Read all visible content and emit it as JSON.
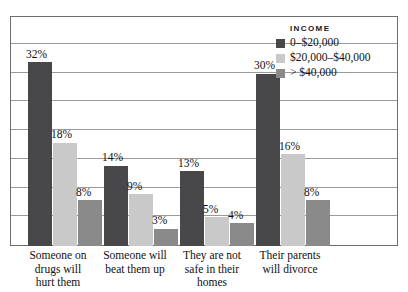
{
  "legend": {
    "title": "INCOME",
    "items": [
      {
        "label": "0–$20,000",
        "color": "#48484a"
      },
      {
        "label": "$20,000–$40,000",
        "color": "#c9c9c9"
      },
      {
        "label": "> $40,000",
        "color": "#8a8a8a"
      }
    ]
  },
  "chart_data": {
    "type": "bar",
    "title": "",
    "xlabel": "",
    "ylabel": "",
    "ylim": [
      0,
      40
    ],
    "grid": true,
    "gridline_values": [
      5,
      10,
      15,
      20,
      25,
      30,
      35,
      40
    ],
    "legend_position": "top-right",
    "categories": [
      "Someone on drugs will hurt them",
      "Someone will beat them up",
      "They are not safe in their homes",
      "Their parents will divorce"
    ],
    "category_lines": [
      [
        "Someone on",
        "drugs will",
        "hurt them"
      ],
      [
        "Someone will",
        "beat them up"
      ],
      [
        "They are not",
        "safe in their",
        "homes"
      ],
      [
        "Their parents",
        "will divorce"
      ]
    ],
    "series": [
      {
        "name": "0–$20,000",
        "color": "#48484a",
        "values": [
          32,
          14,
          13,
          30
        ],
        "labels": [
          "32%",
          "14%",
          "13%",
          "30%"
        ]
      },
      {
        "name": "$20,000–$40,000",
        "color": "#c9c9c9",
        "values": [
          18,
          9,
          5,
          16
        ],
        "labels": [
          "18%",
          "9%",
          "5%",
          "16%"
        ]
      },
      {
        "name": "> $40,000",
        "color": "#8a8a8a",
        "values": [
          8,
          3,
          4,
          8
        ],
        "labels": [
          "8%",
          "3%",
          "4%",
          "8%"
        ]
      }
    ]
  }
}
